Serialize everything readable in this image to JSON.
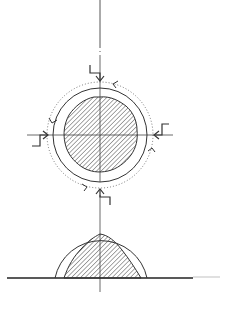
{
  "drawing": {
    "type": "technical-section-drawing",
    "stroke_color": "#3a3a3a",
    "background": "#ffffff",
    "top_view": {
      "center": [
        100,
        135
      ],
      "outer_circle_radius": 47,
      "dotted_circle_radius": 53,
      "hatched_core_radius": 37,
      "section_markers": [
        "top",
        "left",
        "right",
        "bottom"
      ],
      "rotation_arrows": 4
    },
    "bottom_view": {
      "baseline_y": 278,
      "semicircle_radius": 47,
      "hatched_core_height": 46
    },
    "axis": {
      "vertical_x": 100
    }
  }
}
